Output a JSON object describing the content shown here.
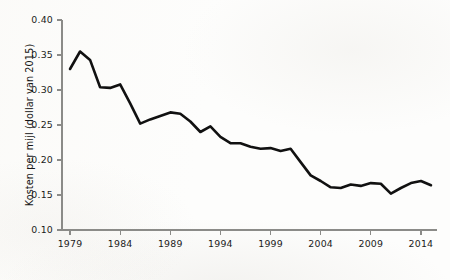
{
  "chart_data": {
    "type": "line",
    "title": "",
    "subtitle": "",
    "xlabel": "",
    "ylabel": "Kosten per mijl (dollar van 2015)",
    "xlim": [
      1978.2,
      2015.6
    ],
    "ylim": [
      0.1,
      0.4
    ],
    "grid": false,
    "legend": "none",
    "x_ticks": [
      1979,
      1984,
      1989,
      1994,
      1999,
      2004,
      2009,
      2014
    ],
    "x_tick_labels": [
      "1979",
      "1984",
      "1989",
      "1994",
      "1999",
      "2004",
      "2009",
      "2014"
    ],
    "y_ticks": [
      0.1,
      0.15,
      0.2,
      0.25,
      0.3,
      0.35,
      0.4
    ],
    "y_tick_labels": [
      "0.10",
      "0.15",
      "0.20",
      "0.25",
      "0.30",
      "0.35",
      "0.40"
    ],
    "line_color": "#111111",
    "axis_color": "#8b8b88",
    "background_color": "#fdfdfc",
    "series": [
      {
        "name": "Kosten per mijl",
        "x": [
          1979,
          1980,
          1981,
          1982,
          1983,
          1984,
          1985,
          1986,
          1987,
          1988,
          1989,
          1990,
          1991,
          1992,
          1993,
          1994,
          1995,
          1996,
          1997,
          1998,
          1999,
          2000,
          2001,
          2002,
          2003,
          2004,
          2005,
          2006,
          2007,
          2008,
          2009,
          2010,
          2011,
          2012,
          2013,
          2014,
          2015
        ],
        "values": [
          0.33,
          0.355,
          0.343,
          0.304,
          0.303,
          0.308,
          0.281,
          0.252,
          0.258,
          0.263,
          0.268,
          0.266,
          0.255,
          0.24,
          0.248,
          0.233,
          0.224,
          0.224,
          0.219,
          0.216,
          0.217,
          0.213,
          0.216,
          0.197,
          0.178,
          0.17,
          0.161,
          0.16,
          0.165,
          0.163,
          0.167,
          0.166,
          0.152,
          0.16,
          0.167,
          0.17,
          0.164
        ]
      }
    ]
  }
}
